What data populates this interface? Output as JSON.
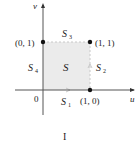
{
  "figure": {
    "panel_label": "I",
    "axes": {
      "x_label": "u",
      "y_label": "v",
      "origin_label": "0"
    },
    "region": {
      "label": "S",
      "fill": "#ebebeb"
    },
    "edges": [
      {
        "name": "S",
        "sub": "1",
        "side": "bottom"
      },
      {
        "name": "S",
        "sub": "2",
        "side": "right"
      },
      {
        "name": "S",
        "sub": "3",
        "side": "top"
      },
      {
        "name": "S",
        "sub": "4",
        "side": "left"
      }
    ],
    "points": [
      {
        "label": "(0, 1)",
        "u": 0,
        "v": 1
      },
      {
        "label": "(1, 1)",
        "u": 1,
        "v": 1
      },
      {
        "label": "(1, 0)",
        "u": 1,
        "v": 0
      }
    ]
  }
}
